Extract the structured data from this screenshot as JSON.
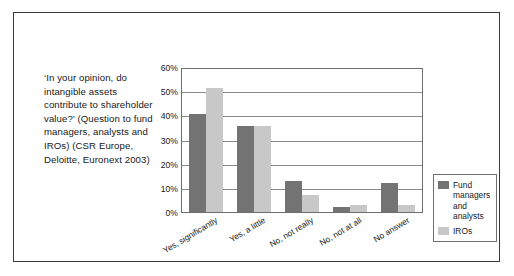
{
  "caption": {
    "text": "‘In your opinion, do intangible assets contribute to shareholder value?’ (Question to fund managers, analysts and IROs) (CSR Europe, Deloitte, Euronext 2003)"
  },
  "chart_data": {
    "type": "bar",
    "title": "",
    "xlabel": "",
    "ylabel": "",
    "ylim": [
      0,
      60
    ],
    "ytick_labels": [
      "0%",
      "10%",
      "20%",
      "30%",
      "40%",
      "50%",
      "60%"
    ],
    "ytick_values": [
      0,
      10,
      20,
      30,
      40,
      50,
      60
    ],
    "grid": true,
    "legend_position": "right",
    "categories": [
      "Yes, significantly",
      "Yes, a little",
      "No, not really",
      "No, not at all",
      "No answer"
    ],
    "series": [
      {
        "name": "Fund managers and analysts",
        "color": "#737373",
        "values": [
          41,
          36,
          13,
          2,
          12
        ]
      },
      {
        "name": "IROs",
        "color": "#c8c8c8",
        "values": [
          52,
          36,
          7,
          3,
          3
        ]
      }
    ]
  }
}
